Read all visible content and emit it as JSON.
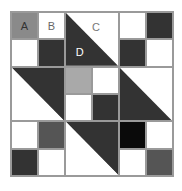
{
  "diagram": {
    "type": "quilt-block",
    "grid": {
      "rows": 6,
      "cols": 6
    },
    "colors": {
      "white": "#ffffff",
      "dark": "#333333",
      "mid_gray": "#555555",
      "gray": "#8a8a8a",
      "light_gray": "#a9a9a9",
      "black": "#0a0a0a",
      "grid_line": "#9a9a9a"
    },
    "cells": [
      {
        "row": 0,
        "col": 0,
        "fill": "#8a8a8a",
        "label": "A"
      },
      {
        "row": 0,
        "col": 1,
        "fill": "#ffffff",
        "label": "B"
      },
      {
        "row": 0,
        "col": 4,
        "fill": "#ffffff"
      },
      {
        "row": 0,
        "col": 5,
        "fill": "#333333"
      },
      {
        "row": 1,
        "col": 0,
        "fill": "#ffffff"
      },
      {
        "row": 1,
        "col": 1,
        "fill": "#333333"
      },
      {
        "row": 1,
        "col": 4,
        "fill": "#333333"
      },
      {
        "row": 1,
        "col": 5,
        "fill": "#ffffff"
      },
      {
        "row": 2,
        "col": 2,
        "fill": "#a9a9a9"
      },
      {
        "row": 2,
        "col": 3,
        "fill": "#ffffff"
      },
      {
        "row": 3,
        "col": 2,
        "fill": "#ffffff"
      },
      {
        "row": 3,
        "col": 3,
        "fill": "#333333"
      },
      {
        "row": 4,
        "col": 0,
        "fill": "#ffffff"
      },
      {
        "row": 4,
        "col": 1,
        "fill": "#555555"
      },
      {
        "row": 4,
        "col": 4,
        "fill": "#0a0a0a"
      },
      {
        "row": 4,
        "col": 5,
        "fill": "#ffffff"
      },
      {
        "row": 5,
        "col": 0,
        "fill": "#333333"
      },
      {
        "row": 5,
        "col": 1,
        "fill": "#ffffff"
      },
      {
        "row": 5,
        "col": 4,
        "fill": "#ffffff"
      },
      {
        "row": 5,
        "col": 5,
        "fill": "#555555"
      }
    ],
    "half_square_triangles": [
      {
        "row": 0,
        "col": 2,
        "span": 2,
        "diagonal": "top-left-to-bottom-right",
        "lower_left": "#333333",
        "upper_right": "#ffffff",
        "labels": {
          "upper_right": "C",
          "lower_left": "D"
        }
      },
      {
        "row": 2,
        "col": 0,
        "span": 2,
        "diagonal": "top-left-to-bottom-right",
        "lower_left": "#ffffff",
        "upper_right": "#333333"
      },
      {
        "row": 2,
        "col": 4,
        "span": 2,
        "diagonal": "top-left-to-bottom-right",
        "lower_left": "#333333",
        "upper_right": "#ffffff"
      },
      {
        "row": 4,
        "col": 2,
        "span": 2,
        "diagonal": "top-left-to-bottom-right",
        "lower_left": "#ffffff",
        "upper_right": "#333333"
      }
    ],
    "labels": {
      "a": "A",
      "b": "B",
      "c": "C",
      "d": "D"
    },
    "label_colors": {
      "a": "#333333",
      "b": "#666666",
      "c": "#777777",
      "d": "#ffffff"
    }
  }
}
